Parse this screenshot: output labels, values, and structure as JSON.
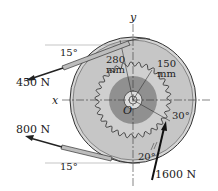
{
  "diagram": {
    "type": "mechanics free-body figure: pulley drum with gear",
    "axes": {
      "x_label": "x",
      "y_label": "y",
      "origin_label": "O"
    },
    "forces": [
      {
        "id": "f450",
        "label": "450 N",
        "angle_label": "15°",
        "position": "upper-left belt"
      },
      {
        "id": "f800",
        "label": "800 N",
        "angle_label": "15°",
        "position": "lower-left belt"
      },
      {
        "id": "f1600",
        "label": "1600 N",
        "angle_label": "20°",
        "position": "gear tooth, lower right"
      }
    ],
    "dimensions": [
      {
        "id": "r280",
        "value": "280",
        "unit": "mm"
      },
      {
        "id": "r150",
        "value": "150",
        "unit": "mm"
      }
    ],
    "angles": {
      "gear_contact": "30°"
    },
    "colors": {
      "outer_disk": "#c9c9c9",
      "outer_rim": "#d8d8d8",
      "hub_dark": "#8f8f8f",
      "hub_light": "#d9d9d9",
      "belt": "#bdbdbd",
      "ink": "#222222"
    }
  }
}
